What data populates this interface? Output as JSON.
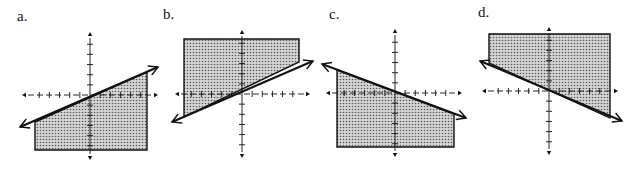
{
  "figure": {
    "colors": {
      "ink": "#111111",
      "shade": "#bdbdbd",
      "background": "#ffffff"
    },
    "panels": [
      {
        "label": "a.",
        "line_slope": "positive",
        "shaded_side": "below",
        "label_pos": [
          17,
          22
        ],
        "axis": {
          "cx": 90,
          "cy": 95,
          "x0": 22,
          "x1": 158,
          "y0": 32,
          "y1": 160
        },
        "region": [
          [
            35,
            122
          ],
          [
            147,
            72
          ],
          [
            147,
            150
          ],
          [
            35,
            150
          ]
        ],
        "line": [
          [
            20,
            127
          ],
          [
            158,
            67
          ]
        ]
      },
      {
        "label": "b.",
        "line_slope": "positive",
        "shaded_side": "above",
        "label_pos": [
          163,
          20
        ],
        "axis": {
          "cx": 242,
          "cy": 94,
          "x0": 175,
          "x1": 310,
          "y0": 30,
          "y1": 158
        },
        "region": [
          [
            184,
            39
          ],
          [
            299,
            39
          ],
          [
            299,
            62
          ],
          [
            184,
            117
          ]
        ],
        "line": [
          [
            172,
            122
          ],
          [
            313,
            61
          ]
        ]
      },
      {
        "label": "c.",
        "line_slope": "negative",
        "shaded_side": "below",
        "label_pos": [
          329,
          20
        ],
        "axis": {
          "cx": 395,
          "cy": 93,
          "x0": 326,
          "x1": 462,
          "y0": 29,
          "y1": 157
        },
        "region": [
          [
            337,
            70
          ],
          [
            454,
            114
          ],
          [
            454,
            147
          ],
          [
            337,
            147
          ]
        ],
        "line": [
          [
            322,
            64
          ],
          [
            466,
            118
          ]
        ]
      },
      {
        "label": "d.",
        "line_slope": "negative",
        "shaded_side": "above",
        "label_pos": [
          478,
          18
        ],
        "axis": {
          "cx": 549,
          "cy": 91,
          "x0": 482,
          "x1": 618,
          "y0": 27,
          "y1": 155
        },
        "region": [
          [
            489,
            34
          ],
          [
            610,
            34
          ],
          [
            610,
            118
          ],
          [
            489,
            63
          ]
        ],
        "line": [
          [
            480,
            61
          ],
          [
            622,
            121
          ]
        ]
      }
    ]
  }
}
